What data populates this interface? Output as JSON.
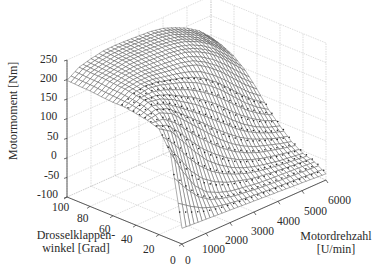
{
  "chart_data": {
    "type": "surface3d",
    "title": "",
    "xlabel": "Motordrehzahl [U/min]",
    "ylabel": "Drosselklappen-winkel [Grad]",
    "zlabel": "Motormoment [Nm]",
    "xlabel_lines": [
      "Motordrehzahl",
      "[U/min]"
    ],
    "ylabel_lines": [
      "Drosselklappen-",
      "winkel [Grad]"
    ],
    "x_ticks": [
      0,
      1000,
      2000,
      3000,
      4000,
      5000,
      6000
    ],
    "y_ticks": [
      0,
      20,
      40,
      60,
      80,
      100
    ],
    "z_ticks": [
      -100,
      -50,
      0,
      50,
      100,
      150,
      200,
      250
    ],
    "xlim": [
      0,
      6000
    ],
    "ylim": [
      0,
      100
    ],
    "zlim": [
      -100,
      250
    ],
    "grid": true,
    "legend": null,
    "x": [
      0,
      500,
      1000,
      1500,
      2000,
      2500,
      3000,
      3500,
      4000,
      4500,
      5000,
      5500,
      6000
    ],
    "y": [
      0,
      10,
      20,
      30,
      40,
      50,
      60,
      70,
      80,
      90,
      100
    ],
    "z_description": "Engine torque map: ~ -60 Nm at closed throttle across speeds, rising steeply with throttle angle to a plateau of ~180-230 Nm above ~40 deg, peak near 2500-4000 U/min, falling off slightly at high rpm and low throttle.",
    "z": [
      [
        -60,
        -62,
        -64,
        -66,
        -68,
        -70,
        -72,
        -74,
        -76,
        -78,
        -80,
        -82,
        -84
      ],
      [
        120,
        60,
        10,
        -20,
        -35,
        -45,
        -50,
        -55,
        -58,
        -60,
        -62,
        -64,
        -66
      ],
      [
        170,
        150,
        110,
        70,
        35,
        10,
        -10,
        -25,
        -35,
        -42,
        -48,
        -52,
        -56
      ],
      [
        180,
        185,
        170,
        140,
        110,
        80,
        50,
        25,
        5,
        -10,
        -20,
        -30,
        -38
      ],
      [
        185,
        200,
        195,
        180,
        160,
        140,
        115,
        90,
        60,
        35,
        15,
        0,
        -10
      ],
      [
        190,
        205,
        210,
        205,
        195,
        185,
        170,
        150,
        125,
        95,
        65,
        40,
        20
      ],
      [
        190,
        210,
        215,
        215,
        210,
        205,
        200,
        190,
        170,
        145,
        115,
        85,
        60
      ],
      [
        192,
        212,
        220,
        222,
        220,
        218,
        215,
        210,
        198,
        180,
        155,
        125,
        95
      ],
      [
        195,
        215,
        222,
        228,
        228,
        226,
        224,
        220,
        212,
        198,
        178,
        150,
        120
      ],
      [
        196,
        216,
        224,
        230,
        231,
        230,
        228,
        225,
        218,
        205,
        188,
        165,
        135
      ],
      [
        198,
        218,
        226,
        232,
        233,
        232,
        230,
        228,
        222,
        210,
        195,
        175,
        145
      ]
    ]
  },
  "labels": {
    "z_axis": "Motormoment [Nm]",
    "y_axis_line1": "Drosselklappen-",
    "y_axis_line2": "winkel [Grad]",
    "x_axis_line1": "Motordrehzahl",
    "x_axis_line2": "[U/min]"
  },
  "ticks": {
    "z": [
      "250",
      "200",
      "150",
      "100",
      "50",
      "0",
      "-50",
      "-100"
    ],
    "y": [
      "100",
      "80",
      "60",
      "40",
      "20",
      "0"
    ],
    "x": [
      "0",
      "1000",
      "2000",
      "3000",
      "4000",
      "5000",
      "6000"
    ]
  },
  "colors": {
    "mesh": "#4a4a4a",
    "grid": "#c8c8c8",
    "axis": "#333333",
    "points": "#222222"
  }
}
